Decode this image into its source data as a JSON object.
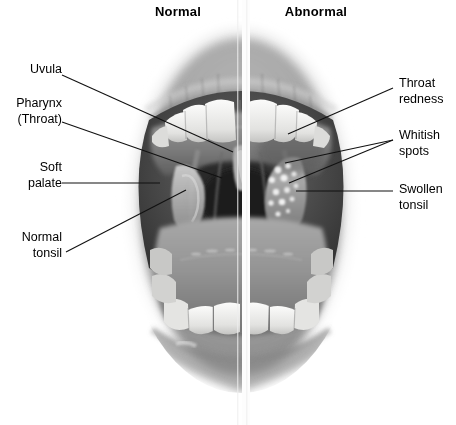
{
  "figure": {
    "title_left": "Normal",
    "title_right": "Abnormal",
    "style": "grayscale-medical-illustration"
  },
  "headers": [
    {
      "name": "normal",
      "label": "Normal",
      "x": 178,
      "y": 13
    },
    {
      "name": "abnormal",
      "label": "Abnormal",
      "x": 316,
      "y": 13
    }
  ],
  "labels": {
    "left": [
      {
        "name": "uvula",
        "lines": [
          "Uvula"
        ],
        "text": "Uvula",
        "anchor_x": 62,
        "anchor_y": 75,
        "target_x": 233,
        "target_y": 152
      },
      {
        "name": "pharynx",
        "lines": [
          "Pharynx",
          "(Throat)"
        ],
        "text": "Pharynx\n(Throat)",
        "anchor_x": 62,
        "anchor_y": 122,
        "target_x": 222,
        "target_y": 178
      },
      {
        "name": "soft-palate",
        "lines": [
          "Soft",
          "palate"
        ],
        "text": "Soft\npalate",
        "anchor_x": 62,
        "anchor_y": 183,
        "target_x": 160,
        "target_y": 183
      },
      {
        "name": "normal-tonsil",
        "lines": [
          "Normal",
          "tonsil"
        ],
        "text": "Normal\ntonsil",
        "anchor_x": 66,
        "anchor_y": 252,
        "target_x": 186,
        "target_y": 190
      }
    ],
    "right": [
      {
        "name": "throat-redness",
        "lines": [
          "Throat",
          "redness"
        ],
        "text": "Throat\nredness",
        "anchor_x": 393,
        "anchor_y": 88,
        "target_x": 288,
        "target_y": 134
      },
      {
        "name": "whitish-spots",
        "lines": [
          "Whitish",
          "spots"
        ],
        "text": "Whitish\nspots",
        "anchor_x": 393,
        "anchor_y": 140,
        "target_x": 285,
        "target_y": 163,
        "target2_x": 289,
        "target2_y": 183
      },
      {
        "name": "swollen-tonsil",
        "lines": [
          "Swollen",
          "tonsil"
        ],
        "text": "Swollen\ntonsil",
        "anchor_x": 393,
        "anchor_y": 191,
        "target_x": 296,
        "target_y": 191
      }
    ]
  },
  "label_text": {
    "uvula": "Uvula",
    "pharynx_1": "Pharynx",
    "pharynx_2": "(Throat)",
    "soft_palate_1": "Soft",
    "soft_palate_2": "palate",
    "normal_tonsil_1": "Normal",
    "normal_tonsil_2": "tonsil",
    "throat_redness_1": "Throat",
    "throat_redness_2": "redness",
    "whitish_spots_1": "Whitish",
    "whitish_spots_2": "spots",
    "swollen_tonsil_1": "Swollen",
    "swollen_tonsil_2": "tonsil"
  },
  "colors": {
    "background": "#ffffff",
    "text": "#000000",
    "leader_line": "#111111",
    "divider": "#fdfdfd",
    "skin_light": "#d8d8d8",
    "skin_mid": "#b4b4b4",
    "lip_dark": "#8d8d8d",
    "cavity_dark": "#3c3c3c",
    "cavity_deep": "#262626",
    "tooth_white": "#f2f2f0",
    "tongue": "#9a9a9a",
    "tonsil_pale": "#c6c6c6",
    "spot_white": "#efefef"
  },
  "divider": {
    "name": "vertical-split",
    "x": 242,
    "width": 8,
    "top": 0,
    "bottom": 425
  }
}
